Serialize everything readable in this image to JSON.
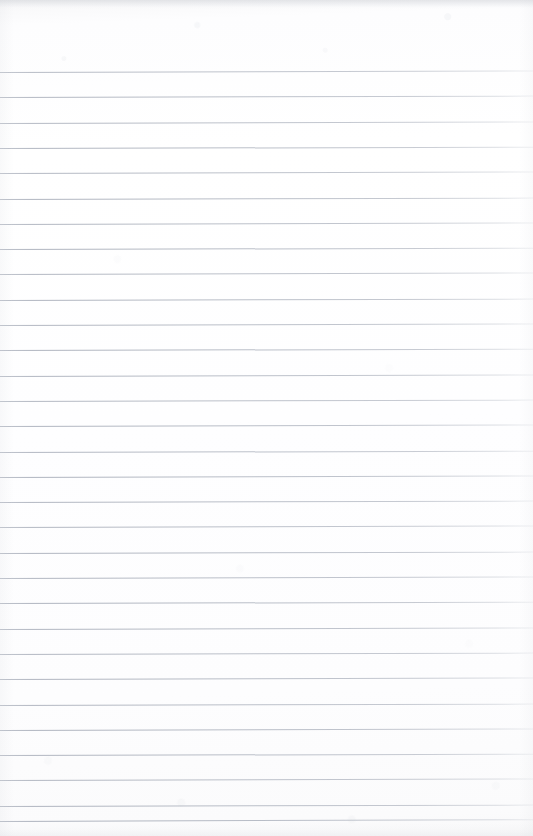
{
  "document": {
    "type": "scanned-lined-paper",
    "title": "Blank ruled notebook page",
    "content_text": "",
    "handwriting_present": false,
    "printed_text_present": false,
    "page_number_visible": false,
    "header_text": "",
    "footer_text": ""
  },
  "page": {
    "width": 533,
    "height": 836,
    "background_color": "#fdfdfe",
    "paper_tone": "off-white",
    "orientation": "portrait"
  },
  "ruling": {
    "style": "horizontal-ruled",
    "line_count": 31,
    "first_line_y": 72,
    "line_spacing": 25.3,
    "line_thickness": 1,
    "line_color": "#a6acb8",
    "margin_rule_present": false,
    "left_inset": 0,
    "right_inset": 0,
    "lines": [
      {
        "index": 1,
        "y": 72.0,
        "tilt": -0.16,
        "opacity": 0.8
      },
      {
        "index": 2,
        "y": 97.3,
        "tilt": -0.15,
        "opacity": 0.84
      },
      {
        "index": 3,
        "y": 122.6,
        "tilt": -0.17,
        "opacity": 0.82
      },
      {
        "index": 4,
        "y": 147.9,
        "tilt": -0.14,
        "opacity": 0.86
      },
      {
        "index": 5,
        "y": 173.2,
        "tilt": -0.16,
        "opacity": 0.83
      },
      {
        "index": 6,
        "y": 198.5,
        "tilt": -0.15,
        "opacity": 0.87
      },
      {
        "index": 7,
        "y": 223.8,
        "tilt": -0.17,
        "opacity": 0.85
      },
      {
        "index": 8,
        "y": 249.1,
        "tilt": -0.14,
        "opacity": 0.88
      },
      {
        "index": 9,
        "y": 274.4,
        "tilt": -0.16,
        "opacity": 0.84
      },
      {
        "index": 10,
        "y": 299.7,
        "tilt": -0.15,
        "opacity": 0.87
      },
      {
        "index": 11,
        "y": 325.0,
        "tilt": -0.16,
        "opacity": 0.85
      },
      {
        "index": 12,
        "y": 350.3,
        "tilt": -0.14,
        "opacity": 0.88
      },
      {
        "index": 13,
        "y": 375.6,
        "tilt": -0.16,
        "opacity": 0.86
      },
      {
        "index": 14,
        "y": 400.9,
        "tilt": -0.15,
        "opacity": 0.84
      },
      {
        "index": 15,
        "y": 426.2,
        "tilt": -0.17,
        "opacity": 0.87
      },
      {
        "index": 16,
        "y": 451.5,
        "tilt": -0.14,
        "opacity": 0.85
      },
      {
        "index": 17,
        "y": 476.8,
        "tilt": -0.16,
        "opacity": 0.88
      },
      {
        "index": 18,
        "y": 502.1,
        "tilt": -0.15,
        "opacity": 0.86
      },
      {
        "index": 19,
        "y": 527.4,
        "tilt": -0.16,
        "opacity": 0.84
      },
      {
        "index": 20,
        "y": 552.7,
        "tilt": -0.15,
        "opacity": 0.87
      },
      {
        "index": 21,
        "y": 578.0,
        "tilt": -0.17,
        "opacity": 0.85
      },
      {
        "index": 22,
        "y": 603.3,
        "tilt": -0.14,
        "opacity": 0.88
      },
      {
        "index": 23,
        "y": 628.6,
        "tilt": -0.16,
        "opacity": 0.86
      },
      {
        "index": 24,
        "y": 653.9,
        "tilt": -0.15,
        "opacity": 0.84
      },
      {
        "index": 25,
        "y": 679.2,
        "tilt": -0.16,
        "opacity": 0.87
      },
      {
        "index": 26,
        "y": 704.5,
        "tilt": -0.15,
        "opacity": 0.85
      },
      {
        "index": 27,
        "y": 729.8,
        "tilt": -0.17,
        "opacity": 0.88
      },
      {
        "index": 28,
        "y": 755.1,
        "tilt": -0.14,
        "opacity": 0.86
      },
      {
        "index": 29,
        "y": 780.4,
        "tilt": -0.16,
        "opacity": 0.84
      },
      {
        "index": 30,
        "y": 805.7,
        "tilt": -0.15,
        "opacity": 0.87
      },
      {
        "index": 31,
        "y": 821.0,
        "tilt": -0.2,
        "opacity": 0.9
      }
    ]
  },
  "scan_artifacts": {
    "top_band_present": true,
    "bottom_band_present": true,
    "grain_present": true,
    "edge_shading_present": true
  }
}
